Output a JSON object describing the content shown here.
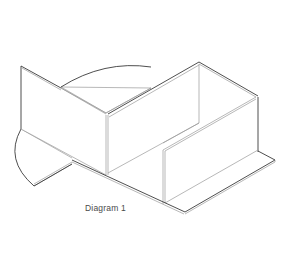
{
  "diagram": {
    "caption": "Diagram 1",
    "line_color": "#3a3a3a",
    "light_line_color": "#9a9a9a"
  }
}
